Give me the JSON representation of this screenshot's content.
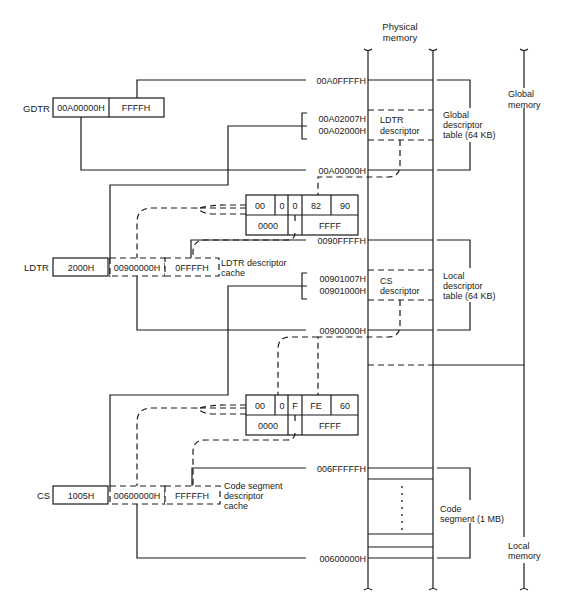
{
  "diagram": {
    "header": {
      "physical_memory_line1": "Physical",
      "physical_memory_line2": "memory"
    },
    "memory_regions": {
      "global_memory": [
        "Global",
        "memory"
      ],
      "local_memory": [
        "Local",
        "memory"
      ],
      "gdt": [
        "Global",
        "descriptor",
        "table (64 KB)"
      ],
      "ldt": [
        "Local",
        "descriptor",
        "table (64 KB)"
      ],
      "code_segment": [
        "Code",
        "segment (1 MB)"
      ]
    },
    "addresses": {
      "gdt_top": "00A0FFFFH",
      "ldtr_desc_hi": "00A02007H",
      "ldtr_desc_lo": "00A02000H",
      "gdt_base": "00A00000H",
      "ldt_top": "0090FFFFH",
      "cs_desc_hi": "00901007H",
      "cs_desc_lo": "00901000H",
      "ldt_base": "00900000H",
      "cs_top": "006FFFFFH",
      "cs_base": "00600000H"
    },
    "memory_blocks": {
      "ldtr_descriptor": [
        "LDTR",
        "descriptor"
      ],
      "cs_descriptor": [
        "CS",
        "descriptor"
      ]
    },
    "registers": {
      "gdtr": {
        "label": "GDTR",
        "base": "00A00000H",
        "limit": "FFFFH"
      },
      "ldtr": {
        "label": "LDTR",
        "selector": "2000H",
        "cache_base": "00900000H",
        "cache_limit": "0FFFFH",
        "cache_label": [
          "LDTR descriptor",
          "cache"
        ]
      },
      "cs": {
        "label": "CS",
        "selector": "1005H",
        "cache_base": "00600000H",
        "cache_limit": "FFFFFH",
        "cache_label": [
          "Code segment",
          "descriptor",
          "cache"
        ]
      }
    },
    "descriptors": {
      "ldtr": {
        "top": [
          "00",
          "0",
          "0",
          "82",
          "90"
        ],
        "bottom": [
          "0000",
          "FFFF"
        ]
      },
      "cs": {
        "top": [
          "00",
          "0",
          "F",
          "FE",
          "60"
        ],
        "bottom": [
          "0000",
          "FFFF"
        ]
      }
    }
  }
}
